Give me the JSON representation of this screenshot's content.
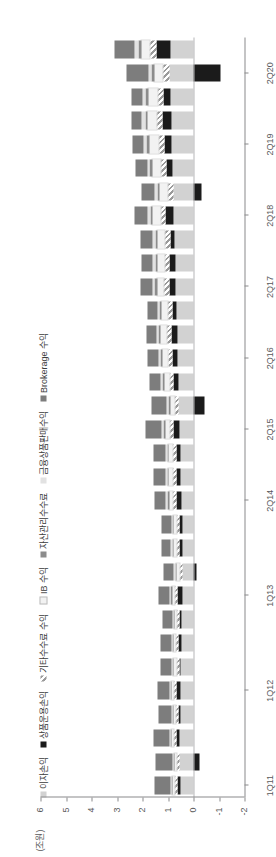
{
  "chart_data": {
    "type": "bar",
    "title": "",
    "subtitle": "",
    "unit_label": "(조원)",
    "xlabel": "",
    "ylabel": "",
    "ylim": [
      -2,
      6
    ],
    "yticks": [
      "6",
      "5",
      "4",
      "3",
      "2",
      "1",
      "0",
      "-1",
      "-2"
    ],
    "grid": false,
    "orientation": "vertical-stacked",
    "stacked": true,
    "legend_position": "top",
    "categories": [
      "1Q11",
      "2Q11",
      "3Q11",
      "4Q11",
      "1Q12",
      "2Q12",
      "3Q12",
      "4Q12",
      "1Q13",
      "2Q13",
      "3Q13",
      "4Q13",
      "2Q14",
      "3Q14",
      "4Q14",
      "2Q15",
      "3Q15",
      "4Q15",
      "2Q16",
      "3Q16",
      "4Q16",
      "2Q17",
      "3Q17",
      "4Q17",
      "2Q18",
      "3Q18",
      "4Q18",
      "2Q19",
      "3Q19",
      "4Q19",
      "2Q20",
      "3Q20"
    ],
    "tick_categories": [
      "1Q11",
      "1Q12",
      "1Q13",
      "2Q14",
      "2Q15",
      "2Q16",
      "2Q17",
      "2Q18",
      "2Q19",
      "2Q20"
    ],
    "series": [
      {
        "name": "이자손익",
        "key": "interest",
        "color": "#d2d2d2",
        "values": [
          0.52,
          0.54,
          0.55,
          0.5,
          0.52,
          0.5,
          0.48,
          0.46,
          0.45,
          0.44,
          0.44,
          0.45,
          0.48,
          0.5,
          0.52,
          0.55,
          0.58,
          0.6,
          0.62,
          0.64,
          0.66,
          0.7,
          0.72,
          0.74,
          0.78,
          0.8,
          0.82,
          0.86,
          0.88,
          0.9,
          0.95,
          0.92
        ]
      },
      {
        "name": "상품운용손익",
        "key": "trading",
        "color": "#1b1b1b",
        "values": [
          0.1,
          -0.25,
          0.12,
          0.08,
          0.14,
          0.06,
          0.1,
          0.08,
          0.16,
          -0.12,
          0.1,
          0.08,
          0.2,
          0.18,
          0.14,
          0.22,
          -0.45,
          0.18,
          0.2,
          0.24,
          0.16,
          0.26,
          0.22,
          0.18,
          0.3,
          -0.3,
          0.24,
          0.28,
          0.32,
          0.26,
          -1.05,
          0.55
        ]
      },
      {
        "name": "기타수수료 수익",
        "key": "other_fee",
        "color": "#9a9a9a",
        "pattern": "diagonal-hatch",
        "values": [
          0.12,
          0.12,
          0.12,
          0.11,
          0.12,
          0.12,
          0.11,
          0.11,
          0.12,
          0.12,
          0.12,
          0.12,
          0.14,
          0.14,
          0.15,
          0.16,
          0.16,
          0.17,
          0.18,
          0.18,
          0.19,
          0.2,
          0.2,
          0.21,
          0.22,
          0.22,
          0.23,
          0.24,
          0.24,
          0.25,
          0.26,
          0.26
        ]
      },
      {
        "name": "IB 수익",
        "key": "ib",
        "color": "#f2f2f2",
        "values": [
          0.08,
          0.08,
          0.08,
          0.09,
          0.09,
          0.09,
          0.1,
          0.1,
          0.11,
          0.11,
          0.12,
          0.12,
          0.14,
          0.15,
          0.16,
          0.18,
          0.18,
          0.2,
          0.22,
          0.23,
          0.24,
          0.26,
          0.27,
          0.28,
          0.3,
          0.31,
          0.32,
          0.34,
          0.35,
          0.36,
          0.3,
          0.32
        ]
      },
      {
        "name": "자산관리수수료",
        "key": "wm",
        "color": "#8c8c8c",
        "values": [
          0.04,
          0.04,
          0.04,
          0.04,
          0.04,
          0.04,
          0.04,
          0.04,
          0.05,
          0.05,
          0.05,
          0.05,
          0.06,
          0.06,
          0.06,
          0.07,
          0.07,
          0.07,
          0.08,
          0.08,
          0.08,
          0.09,
          0.09,
          0.09,
          0.1,
          0.1,
          0.1,
          0.11,
          0.11,
          0.11,
          0.12,
          0.12
        ]
      },
      {
        "name": "금융상품판매수익",
        "key": "product_sales",
        "color": "#e2e2e2",
        "values": [
          0.05,
          0.05,
          0.05,
          0.05,
          0.05,
          0.05,
          0.05,
          0.05,
          0.06,
          0.06,
          0.06,
          0.06,
          0.07,
          0.07,
          0.07,
          0.08,
          0.08,
          0.08,
          0.09,
          0.09,
          0.09,
          0.1,
          0.1,
          0.1,
          0.11,
          0.11,
          0.11,
          0.12,
          0.12,
          0.12,
          0.13,
          0.13
        ]
      },
      {
        "name": "Brokerage 수익",
        "key": "brokerage",
        "color": "#7d7d7d",
        "values": [
          0.62,
          0.66,
          0.6,
          0.5,
          0.46,
          0.42,
          0.4,
          0.38,
          0.44,
          0.4,
          0.38,
          0.36,
          0.44,
          0.46,
          0.48,
          0.62,
          0.58,
          0.44,
          0.42,
          0.4,
          0.4,
          0.46,
          0.44,
          0.46,
          0.52,
          0.48,
          0.46,
          0.44,
          0.42,
          0.44,
          0.85,
          0.8
        ]
      }
    ]
  },
  "legend": {
    "items": [
      {
        "label": "이자손익",
        "swatch": "light-gray-swatch"
      },
      {
        "label": "상품운용손익",
        "swatch": "black-swatch"
      },
      {
        "label": "기타수수료 수익",
        "swatch": "hatched-swatch"
      },
      {
        "label": "IB 수익",
        "swatch": "white-swatch"
      },
      {
        "label": "자산관리수수료",
        "swatch": "mid-gray-swatch"
      },
      {
        "label": "금융상품판매수익",
        "swatch": "pale-gray-swatch"
      },
      {
        "label": "Brokerage 수익",
        "swatch": "dark-gray-swatch"
      }
    ]
  }
}
